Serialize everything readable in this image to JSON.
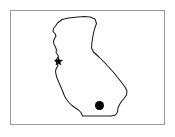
{
  "figure": {
    "title": "California",
    "description": "Outline map of the state of California with two located points",
    "width": 175,
    "height": 137,
    "background_color": "#ffffff"
  },
  "frame": {
    "name": "map-border",
    "stroke_color": "#9a9a9a",
    "fill_color": "#ffffff",
    "x": 10,
    "y": 10,
    "width": 155,
    "height": 115
  },
  "state": {
    "name": "California",
    "outline_color": "#1a1a1a",
    "fill_color": "#ffffff",
    "stroke_width": 1.05,
    "path": "M 57.5 23.0 L 62.0 19.5 L 68.5 18.0 L 78.0 17.0 L 84.5 16.5 L 90.0 17.0 L 95.0 19.0 L 96.5 23.5 L 94.5 29.0 L 93.0 35.5 L 92.0 42.0 L 91.5 48.0 L 93.5 52.0 L 99.0 57.0 L 105.0 63.0 L 110.0 68.5 L 114.5 73.5 L 118.5 78.5 L 122.0 83.0 L 125.0 87.0 L 127.0 91.0 L 126.5 95.0 L 124.0 98.5 L 121.5 101.5 L 119.5 104.5 L 118.0 108.0 L 117.5 112.0 L 115.5 115.0 L 111.0 116.0 L 104.0 116.0 L 96.0 116.0 L 88.0 116.0 L 82.5 116.0 L 81.0 112.5 L 78.5 110.0 L 75.5 108.0 L 72.0 105.5 L 69.0 102.5 L 66.5 99.5 L 64.5 96.0 L 63.0 92.0 L 61.5 88.5 L 60.0 85.0 L 58.5 81.5 L 57.0 78.0 L 56.0 74.5 L 55.5 71.0 L 56.5 68.0 L 58.0 65.5 L 57.0 63.0 L 55.5 61.0 L 57.0 58.5 L 58.5 56.5 L 57.5 54.5 L 56.0 52.5 L 56.5 50.0 L 55.5 47.0 L 54.0 44.5 L 53.5 41.5 L 54.5 38.5 L 56.0 36.0 L 55.0 33.5 L 53.0 31.5 L 53.5 28.5 L 55.5 26.0 Z"
  },
  "markers": [
    {
      "id": "marker-star",
      "icon": "star-marker-icon",
      "shape": "star",
      "color": "#000000",
      "x": 58.5,
      "y": 61.5,
      "size": 9,
      "label": "San Francisco Bay Area"
    },
    {
      "id": "marker-dot",
      "icon": "circle-marker-icon",
      "shape": "circle",
      "color": "#000000",
      "x": 99.5,
      "y": 105.5,
      "size": 9,
      "label": "Southern California"
    }
  ]
}
